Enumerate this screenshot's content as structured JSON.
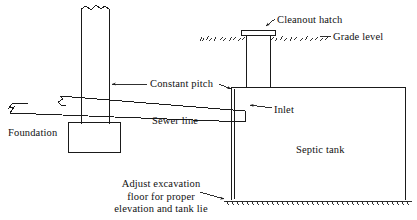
{
  "diagram": {
    "type": "technical-line-drawing",
    "stroke_color": "#1a1a1a",
    "background_color": "#ffffff",
    "labels": {
      "cleanout_hatch": "Cleanout hatch",
      "grade_level": "Grade level",
      "constant_pitch": "Constant pitch",
      "inlet": "Inlet",
      "sewer_line": "Sewer line",
      "foundation": "Foundation",
      "septic_tank": "Septic tank",
      "adjust_excavation": "Adjust excavation\nfloor for proper\nelevation and tank lie"
    },
    "parts": {
      "house_wall": "house-foundation-wall",
      "footing": "foundation-footing",
      "sewer_pipe": "sloped-sewer-pipe",
      "riser": "cleanout-riser",
      "hatch_cap": "cleanout-hatch-cap",
      "tank_body": "septic-tank-body",
      "ground_line": "grade-level-ground-line",
      "excavation_floor": "excavation-floor-hatching",
      "break_symbols": "pipe-break-symbol"
    }
  }
}
